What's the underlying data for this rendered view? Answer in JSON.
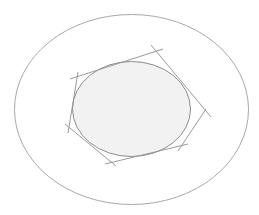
{
  "diagram": {
    "title": "",
    "colors": {
      "background": "#ffffff",
      "outer_stroke": "#a8a8a8",
      "inner_stroke": "#8c8c8c",
      "inner_fill": "#f2f2f2",
      "tangent_stroke": "#9a9a9a"
    },
    "outer_ellipse": {
      "cx": 131.5,
      "cy": 109.5,
      "rx": 117,
      "ry": 95
    },
    "inner_ellipse": {
      "cx": 131.5,
      "cy": 109,
      "rx": 59,
      "ry": 47.5
    },
    "tangent_lines": [
      {
        "id": "top",
        "x1": 70,
        "y1": 79,
        "x2": 163,
        "y2": 49
      },
      {
        "id": "top-right",
        "x1": 151,
        "y1": 45,
        "x2": 211,
        "y2": 117
      },
      {
        "id": "bottom-right",
        "x1": 206,
        "y1": 109,
        "x2": 178,
        "y2": 151
      },
      {
        "id": "bottom",
        "x1": 188,
        "y1": 144,
        "x2": 105,
        "y2": 164
      },
      {
        "id": "bottom-left",
        "x1": 65,
        "y1": 124,
        "x2": 116,
        "y2": 166
      },
      {
        "id": "left",
        "x1": 78,
        "y1": 72,
        "x2": 68,
        "y2": 133
      }
    ]
  }
}
